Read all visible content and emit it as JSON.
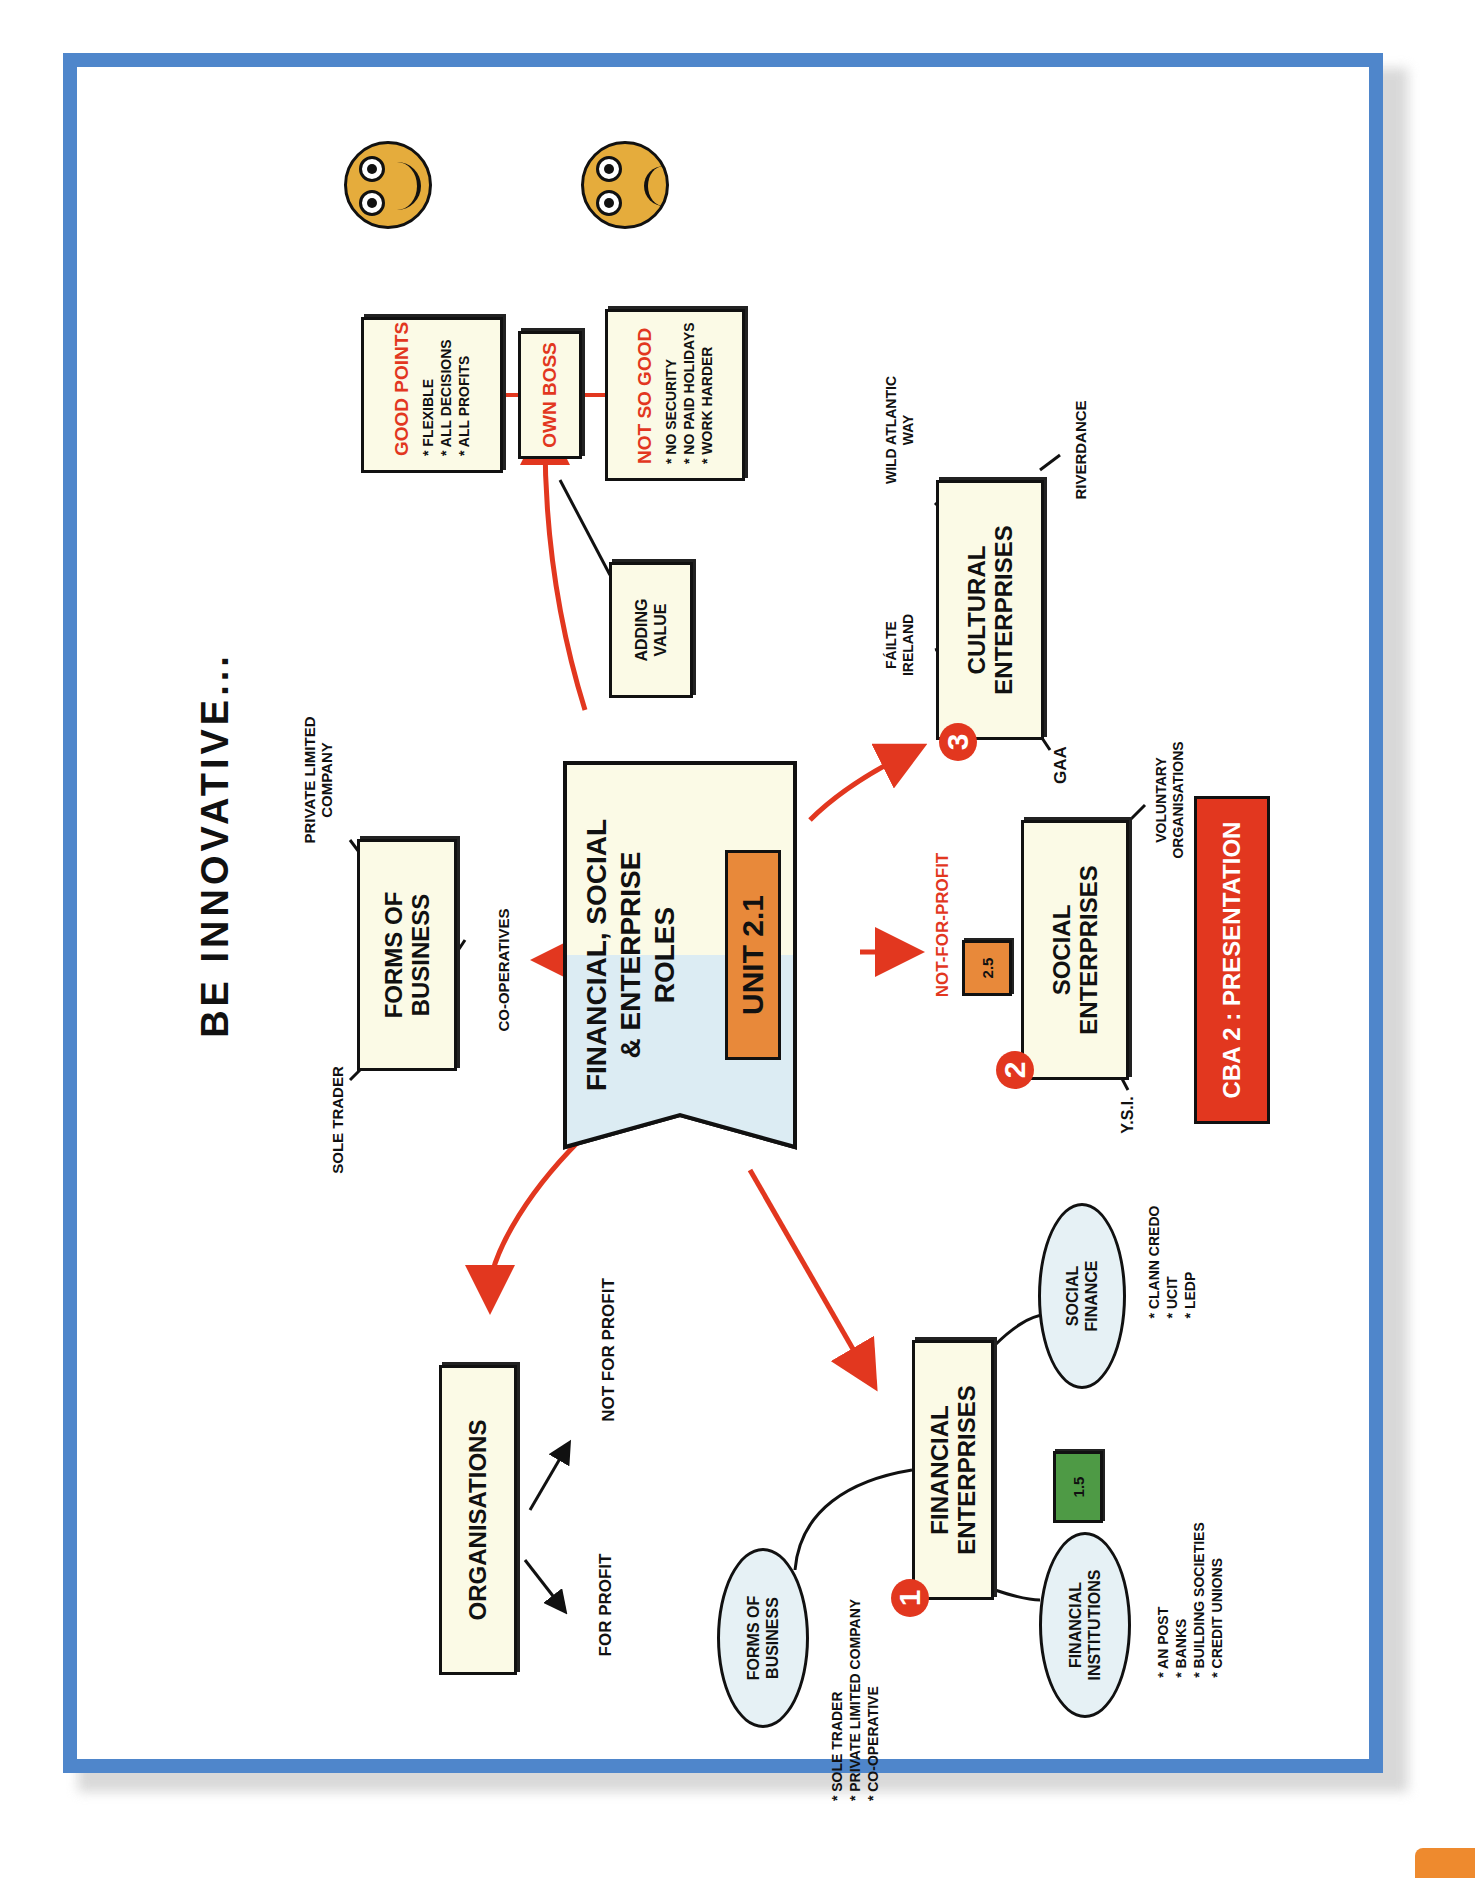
{
  "title": "BE INNOVATIVE...",
  "center": {
    "title_lines": [
      "FINANCIAL, SOCIAL",
      "& ENTERPRISE",
      "ROLES"
    ],
    "unit_label": "UNIT 2.1"
  },
  "forms_of_business": {
    "label_lines": [
      "FORMS OF",
      "BUSINESS"
    ],
    "branches": {
      "sole_trader": "SOLE TRADER",
      "private_limited_lines": [
        "PRIVATE LIMITED",
        "COMPANY"
      ],
      "co_operatives": "CO-OPERATIVES"
    }
  },
  "own_boss": {
    "label": "OWN BOSS",
    "good_points": {
      "heading": "GOOD POINTS",
      "items": [
        "* FLEXIBLE",
        "* ALL DECISIONS",
        "* ALL PROFITS"
      ]
    },
    "not_so_good": {
      "heading": "NOT SO GOOD",
      "items": [
        "* NO SECURITY",
        "* NO PAID HOLIDAYS",
        "* WORK HARDER"
      ]
    },
    "adding_value_lines": [
      "ADDING",
      "VALUE"
    ]
  },
  "faces": {
    "happy": "happy-face-icon",
    "sad": "sad-face-icon"
  },
  "cultural_enterprises": {
    "number": "3",
    "label_lines": [
      "CULTURAL",
      "ENTERPRISES"
    ],
    "branches": {
      "failte_lines": [
        "FÁILTE",
        "IRELAND"
      ],
      "wild_atlantic_lines": [
        "WILD ATLANTIC",
        "WAY"
      ],
      "riverdance": "RIVERDANCE",
      "gaa": "GAA"
    }
  },
  "social_enterprises": {
    "number": "2",
    "label_lines": [
      "SOCIAL",
      "ENTERPRISES"
    ],
    "tag": "2.5",
    "not_for_profit": "NOT-FOR-PROFIT",
    "branches": {
      "voluntary_lines": [
        "VOLUNTARY",
        "ORGANISATIONS"
      ],
      "ysi": "Y.S.I."
    }
  },
  "cba": {
    "label": "CBA 2 : PRESENTATION"
  },
  "organisations": {
    "label": "ORGANISATIONS",
    "for_profit": "FOR PROFIT",
    "not_for_profit": "NOT FOR PROFIT"
  },
  "financial_enterprises": {
    "number": "1",
    "label_lines": [
      "FINANCIAL",
      "ENTERPRISES"
    ],
    "tag": "1.5",
    "forms_of_business": {
      "label_lines": [
        "FORMS OF",
        "BUSINESS"
      ],
      "items": [
        "* SOLE TRADER",
        "* PRIVATE LIMITED COMPANY",
        "* CO-OPERATIVE"
      ]
    },
    "financial_institutions": {
      "label_lines": [
        "FINANCIAL",
        "INSTITUTIONS"
      ],
      "items": [
        "* AN POST",
        "* BANKS",
        "* BUILDING SOCIETIES",
        "* CREDIT UNIONS"
      ]
    },
    "social_finance": {
      "label_lines": [
        "SOCIAL",
        "FINANCE"
      ],
      "items": [
        "* CLANN CREDO",
        "* UCIT",
        "* LEDP"
      ]
    }
  },
  "colors": {
    "frame_blue": "#4f86cb",
    "accent_red": "#e2371f",
    "unit_orange": "#e8893a",
    "tag_green": "#4e9a45",
    "box_cream": "#fbfae6",
    "ellipse_blue": "#e6f1f5",
    "face_yellow": "#e5ac3c"
  }
}
